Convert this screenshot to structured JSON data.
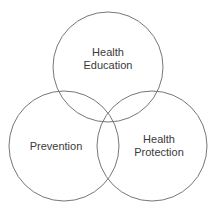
{
  "diagram": {
    "type": "venn",
    "stroke_color": "#777777",
    "circles": [
      {
        "id": "health-education",
        "line1": "Health",
        "line2": "Education",
        "cx": 108,
        "cy": 67,
        "r": 55
      },
      {
        "id": "prevention",
        "line1": "Prevention",
        "line2": "",
        "cx": 64,
        "cy": 146,
        "r": 55
      },
      {
        "id": "health-protection",
        "line1": "Health",
        "line2": "Protection",
        "cx": 152,
        "cy": 146,
        "r": 55
      }
    ]
  }
}
